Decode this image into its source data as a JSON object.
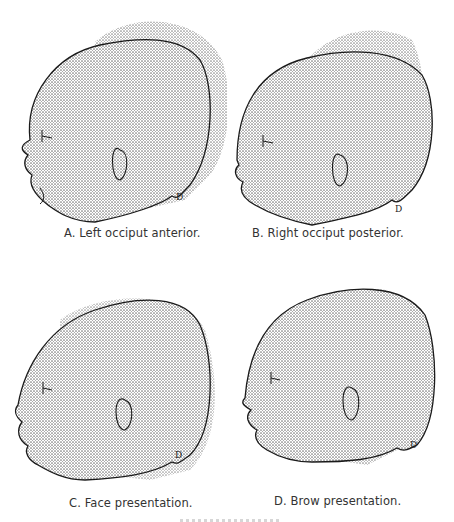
{
  "figure": {
    "panels": [
      {
        "id": "A",
        "caption": "A. Left occiput anterior."
      },
      {
        "id": "B",
        "caption": "B. Right occiput posterior."
      },
      {
        "id": "C",
        "caption": "C. Face presentation."
      },
      {
        "id": "D",
        "caption": "D. Brow presentation."
      }
    ],
    "colors": {
      "stipple": "#9a9a9a",
      "outline": "#1a1a1a",
      "background": "#ffffff"
    }
  }
}
